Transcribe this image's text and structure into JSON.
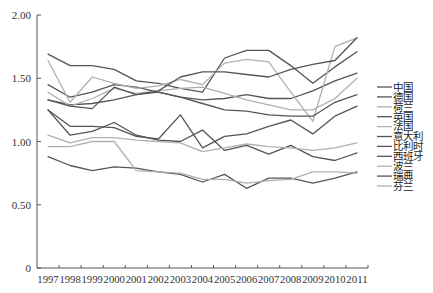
{
  "chart_data": {
    "type": "line",
    "title": "",
    "xlabel": "",
    "ylabel": "",
    "ylim": [
      0,
      2.0
    ],
    "yticks": [
      "0",
      "0.50",
      "1.00",
      "1.50",
      "2.00"
    ],
    "ytick_values": [
      0,
      0.5,
      1.0,
      1.5,
      2.0
    ],
    "categories": [
      "1997",
      "1998",
      "1999",
      "2000",
      "2001",
      "2002",
      "2003",
      "2004",
      "2005",
      "2006",
      "2007",
      "2008",
      "2009",
      "2010",
      "2011"
    ],
    "grid": false,
    "legend_position": "right",
    "series": [
      {
        "name": "中国",
        "shade": "dark",
        "values": [
          1.69,
          1.6,
          1.6,
          1.57,
          1.48,
          1.46,
          1.42,
          1.39,
          1.66,
          1.72,
          1.72,
          1.6,
          1.46,
          1.59,
          1.71
        ]
      },
      {
        "name": "德国",
        "shade": "dark",
        "values": [
          1.45,
          1.35,
          1.39,
          1.45,
          1.43,
          1.39,
          1.35,
          1.33,
          1.34,
          1.37,
          1.34,
          1.34,
          1.4,
          1.48,
          1.54
        ]
      },
      {
        "name": "荷兰",
        "shade": "light",
        "values": [
          1.64,
          1.31,
          1.51,
          1.46,
          1.42,
          1.44,
          1.49,
          1.45,
          1.62,
          1.65,
          1.63,
          1.39,
          1.16,
          1.75,
          1.82
        ]
      },
      {
        "name": "英国",
        "shade": "dark",
        "values": [
          1.33,
          1.29,
          1.3,
          1.33,
          1.37,
          1.39,
          1.35,
          1.3,
          1.25,
          1.24,
          1.21,
          1.2,
          1.2,
          1.31,
          1.37
        ]
      },
      {
        "name": "法国",
        "shade": "light",
        "values": [
          1.39,
          1.28,
          1.34,
          1.42,
          1.38,
          1.4,
          1.42,
          1.43,
          1.38,
          1.33,
          1.29,
          1.25,
          1.25,
          1.34,
          1.5
        ]
      },
      {
        "name": "意大利",
        "shade": "dark",
        "values": [
          1.25,
          1.12,
          1.12,
          1.11,
          1.04,
          1.02,
          1.21,
          0.95,
          1.04,
          1.06,
          1.12,
          1.17,
          1.06,
          1.2,
          1.28
        ]
      },
      {
        "name": "比利时",
        "shade": "dark",
        "values": [
          1.25,
          1.05,
          1.08,
          1.15,
          1.05,
          1.01,
          1.0,
          1.09,
          0.93,
          0.97,
          0.9,
          0.97,
          0.88,
          0.85,
          0.91
        ]
      },
      {
        "name": "西班牙",
        "shade": "dark",
        "values": [
          1.33,
          1.28,
          1.26,
          1.43,
          1.37,
          1.4,
          1.51,
          1.55,
          1.55,
          1.53,
          1.51,
          1.57,
          1.61,
          1.64,
          1.82
        ]
      },
      {
        "name": "波兰",
        "shade": "light",
        "values": [
          1.05,
          0.99,
          1.03,
          1.03,
          1.01,
          1.0,
          0.99,
          0.92,
          0.95,
          0.98,
          0.96,
          0.95,
          0.93,
          0.95,
          0.99
        ]
      },
      {
        "name": "瑞典",
        "shade": "dark",
        "values": [
          0.88,
          0.81,
          0.77,
          0.8,
          0.79,
          0.76,
          0.74,
          0.68,
          0.74,
          0.63,
          0.71,
          0.71,
          0.67,
          0.71,
          0.76
        ]
      },
      {
        "name": "芬兰",
        "shade": "light",
        "values": [
          0.96,
          0.96,
          1.0,
          1.0,
          0.77,
          0.76,
          0.75,
          0.7,
          0.7,
          0.67,
          0.69,
          0.7,
          0.76,
          0.76,
          0.75
        ]
      }
    ]
  },
  "colors": {
    "dark": "#555555",
    "light": "#b0b0b0",
    "axis": "#555555"
  }
}
